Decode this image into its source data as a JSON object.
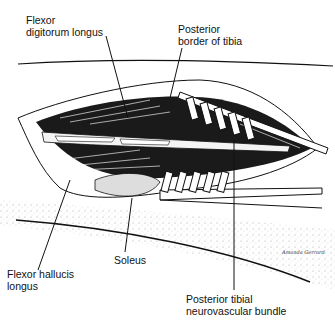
{
  "figure": {
    "colors": {
      "ink": "#111111",
      "background": "#ffffff",
      "stipple": "#9a9a9a"
    }
  },
  "labels": {
    "fdl_line1": "Flexor",
    "fdl_line2": "digitorum longus",
    "ptb_line1": "Posterior",
    "ptb_line2": "border of tibia",
    "fhl_line1": "Flexor hallucis",
    "fhl_line2": "longus",
    "soleus": "Soleus",
    "ptnb_line1": "Posterior tibial",
    "ptnb_line2": "neurovascular bundle"
  },
  "signature": "Amanda Gerrard"
}
